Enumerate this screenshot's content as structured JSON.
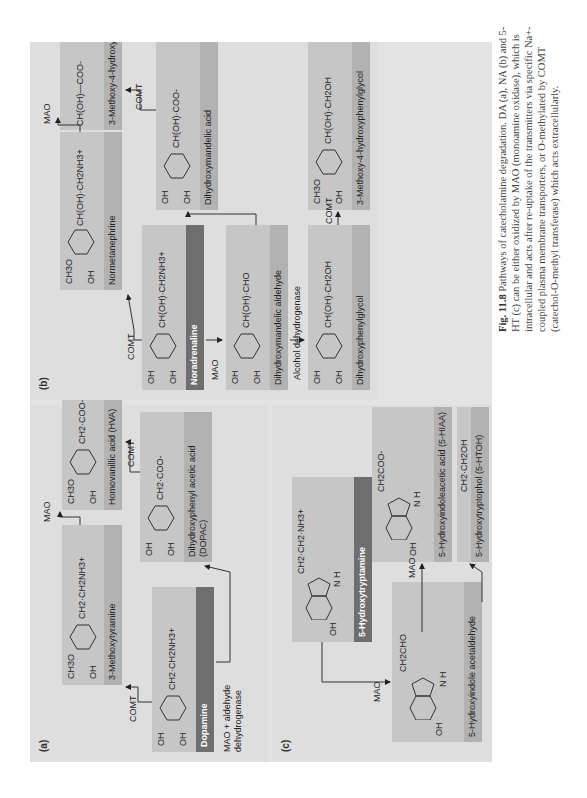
{
  "figure": {
    "number": "Fig. 11.8",
    "caption": "Pathways of catecholamine degradation. DA (a), NA (b) and 5-HT (c) can be either oxidized by MAO (monoamine oxidase), which is intracellular and acts after re-uptake of the transmitters via specific Na+-coupled plasma membrane transporters, or O-methylated by COMT (catechol-O-methyl transferase) which acts extracellularly.",
    "orientation": "rotated 90° counter-clockwise"
  },
  "panel_a": {
    "label": "(a)",
    "compounds": {
      "dopamine": {
        "name": "Dopamine",
        "sidechain": "CH2·CH2NH3+",
        "substituents": [
          "OH",
          "OH"
        ]
      },
      "methoxytyramine": {
        "name": "3-Methoxytyramine",
        "sidechain": "CH2·CH2NH3+",
        "substituents": [
          "CH3O",
          "OH"
        ]
      },
      "dopac": {
        "name": "Dihydroxyphenyl acetic acid (DOPAC)",
        "sidechain": "CH2·COO-",
        "substituents": [
          "OH",
          "OH"
        ]
      },
      "hva": {
        "name": "Homovanillic acid (HVA)",
        "sidechain": "CH2·COO-",
        "substituents": [
          "CH3O",
          "OH"
        ]
      }
    },
    "enzymes": {
      "comt_1": "COMT",
      "mao_1": "MAO",
      "mao_aldehyde": "MAO + aldehyde dehydrogenase",
      "comt_2": "COMT"
    }
  },
  "panel_b": {
    "label": "(b)",
    "compounds": {
      "noradrenaline": {
        "name": "Noradrenaline",
        "sidechain": "CH(OH)·CH2NH3+",
        "substituents": [
          "OH",
          "OH"
        ]
      },
      "normetanephrine": {
        "name": "Normetanephrine",
        "sidechain": "CH(OH)·CH2NH3+",
        "substituents": [
          "CH3O",
          "OH"
        ]
      },
      "methoxy_hydroxymandelic": {
        "name": "3-Methoxy-4-hydroxymandelic acid",
        "sidechain": "CH(OH)—COO-",
        "substituents": [
          "CH3O",
          "OH"
        ]
      },
      "dihydroxymandelic_aldehyde": {
        "name": "Dihydroxymandelic aldehyde",
        "sidechain": "CH(OH)·CHO",
        "substituents": [
          "OH",
          "OH"
        ]
      },
      "dihydroxymandelic_acid": {
        "name": "Dihydroxymandelic acid",
        "sidechain": "CH(OH)·COO-",
        "substituents": [
          "OH",
          "OH"
        ]
      },
      "dihydroxyphenylglycol": {
        "name": "Dihydroxyphenylglycol",
        "sidechain": "CH(OH)·CH2OH",
        "substituents": [
          "OH",
          "OH"
        ]
      },
      "methoxy_hydroxyphenylglycol": {
        "name": "3-Methoxy-4-hydroxyphenylglycol",
        "sidechain": "CH(OH)·CH2OH",
        "substituents": [
          "CH3O",
          "OH"
        ]
      }
    },
    "enzymes": {
      "comt_1": "COMT",
      "mao_1": "MAO",
      "mao_2": "MAO",
      "comt_2": "COMT",
      "alcohol_dh": "Alcohol dehydrogenase",
      "comt_3": "COMT"
    }
  },
  "panel_c": {
    "label": "(c)",
    "compounds": {
      "serotonin": {
        "name": "5-Hydroxytryptamine",
        "sidechain": "CH2·CH2·NH3+",
        "substituents": [
          "OH"
        ],
        "ring_nh": "N H"
      },
      "acetaldehyde": {
        "name": "5-Hydroxyindole acetaldehyde",
        "sidechain": "CH2CHO",
        "substituents": [
          "OH"
        ],
        "ring_nh": "N H"
      },
      "hiaa": {
        "name": "5-Hydroxyindoleacetic acid (5-HIAA)",
        "sidechain": "CH2COO-",
        "substituents": [
          "OH"
        ],
        "ring_nh": "N H"
      },
      "htoh": {
        "name": "5-Hydroxytryptophol (5-HTOH)",
        "sidechain": "CH2·CH2OH",
        "substituents": [
          "OH"
        ],
        "ring_nh": "N H"
      }
    },
    "enzymes": {
      "mao_1": "MAO",
      "mao_2": "MAO"
    }
  },
  "colors": {
    "page_bg": "#ffffff",
    "frame_bg": "#e3e3e3",
    "panel_bg": "#dedede",
    "box_bg": "#c6c6c6",
    "strip_bg": "#b2b2b2",
    "dark_strip_bg": "#6e6e6e",
    "text": "#222222"
  }
}
